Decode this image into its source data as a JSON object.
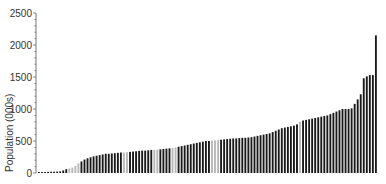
{
  "chart_data": {
    "type": "bar",
    "title": "",
    "xlabel": "",
    "ylabel": "Population (000s)",
    "ylim": [
      0,
      2500
    ],
    "yticks": [
      0,
      500,
      1000,
      1500,
      2000,
      2500
    ],
    "ytick_labels": [
      "0",
      "500",
      "1000",
      "1500",
      "2000",
      "2500"
    ],
    "grid": false,
    "legend": null,
    "sorted": "ascending",
    "series": [
      {
        "name": "Population",
        "color_default": "#1a1a1a",
        "color_highlight": "#b8b8b8",
        "values": [
          15,
          15,
          15,
          18,
          20,
          20,
          22,
          25,
          40,
          60,
          70,
          85,
          110,
          150,
          180,
          210,
          230,
          245,
          260,
          270,
          280,
          290,
          300,
          300,
          305,
          310,
          315,
          320,
          320,
          325,
          330,
          335,
          340,
          345,
          350,
          350,
          355,
          360,
          360,
          365,
          370,
          375,
          380,
          385,
          390,
          400,
          410,
          420,
          430,
          440,
          450,
          460,
          470,
          480,
          490,
          500,
          500,
          505,
          510,
          515,
          520,
          525,
          530,
          535,
          540,
          540,
          545,
          550,
          550,
          555,
          560,
          570,
          580,
          590,
          600,
          610,
          620,
          640,
          660,
          680,
          700,
          710,
          720,
          730,
          740,
          760,
          800,
          820,
          830,
          840,
          850,
          860,
          870,
          880,
          890,
          900,
          920,
          940,
          960,
          980,
          1000,
          1000,
          1000,
          1010,
          1080,
          1150,
          1230,
          1480,
          1510,
          1530,
          1530,
          2150
        ],
        "highlighted_indices": [
          10,
          11,
          12,
          13,
          28,
          29,
          38,
          39,
          44,
          45,
          57,
          58,
          59,
          86
        ]
      }
    ]
  }
}
